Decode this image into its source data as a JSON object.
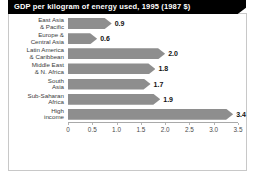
{
  "chart_data": {
    "type": "bar",
    "orientation": "horizontal",
    "title": "GDP per kilogram of energy used, 1995 (1987 $)",
    "xlabel": "",
    "ylabel": "",
    "xlim": [
      0,
      3.5
    ],
    "grid": false,
    "legend": null,
    "bar_color": "#8e8e8e",
    "title_bar_color": "#000000",
    "title_text_color": "#ffffff",
    "xticks": [
      "0",
      "0.5",
      "1.0",
      "1.5",
      "2.0",
      "2.5",
      "3.0",
      "3.5"
    ],
    "xtick_values": [
      0,
      0.5,
      1.0,
      1.5,
      2.0,
      2.5,
      3.0,
      3.5
    ],
    "categories": [
      "East Asia\n& Pacific",
      "Europe &\nCentral Asia",
      "Latin America\n& Caribbean",
      "Middle East\n& N. Africa",
      "South\nAsia",
      "Sub-Saharan\nAfrica",
      "High\nincome"
    ],
    "category_lines": [
      [
        "East Asia",
        "& Pacific"
      ],
      [
        "Europe &",
        "Central Asia"
      ],
      [
        "Latin America",
        "& Caribbean"
      ],
      [
        "Middle East",
        "& N. Africa"
      ],
      [
        "South",
        "Asia"
      ],
      [
        "Sub-Saharan",
        "Africa"
      ],
      [
        "High",
        "income"
      ]
    ],
    "values": [
      0.9,
      0.6,
      2.0,
      1.8,
      1.7,
      1.9,
      3.4
    ],
    "value_labels": [
      "0.9",
      "0.6",
      "2.0",
      "1.8",
      "1.7",
      "1.9",
      "3.4"
    ]
  }
}
